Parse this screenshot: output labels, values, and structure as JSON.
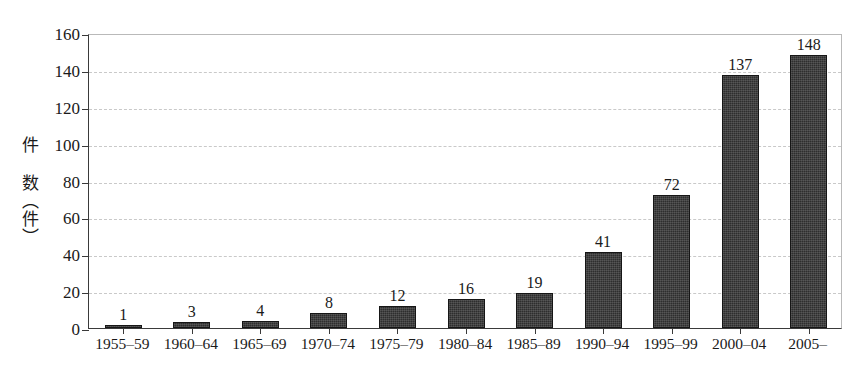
{
  "chart_data": {
    "type": "bar",
    "title": "",
    "xlabel": "",
    "ylabel": "件 数（件）",
    "ylim": [
      0,
      160
    ],
    "ytick_step": 20,
    "yticks": [
      0,
      20,
      40,
      60,
      80,
      100,
      120,
      140,
      160
    ],
    "ytick_labels": [
      "0",
      "20",
      "40",
      "60",
      "80",
      "100",
      "120",
      "140",
      "160"
    ],
    "grid": true,
    "grid_axis": "y",
    "grid_style": "dashed",
    "legend": false,
    "legend_position": "none",
    "bar_color": "#2e2e2e",
    "grid_color": "#c9c9c9",
    "axis_color": "#3a3a3a",
    "show_value_labels": true,
    "categories": [
      "1955–59",
      "1960–64",
      "1965–69",
      "1970–74",
      "1975–79",
      "1980–84",
      "1985–89",
      "1990–94",
      "1995–99",
      "2000–04",
      "2005–"
    ],
    "values": [
      1,
      3,
      4,
      8,
      12,
      16,
      19,
      41,
      72,
      137,
      148
    ],
    "value_labels": [
      "1",
      "3",
      "4",
      "8",
      "12",
      "16",
      "19",
      "41",
      "72",
      "137",
      "148"
    ]
  }
}
